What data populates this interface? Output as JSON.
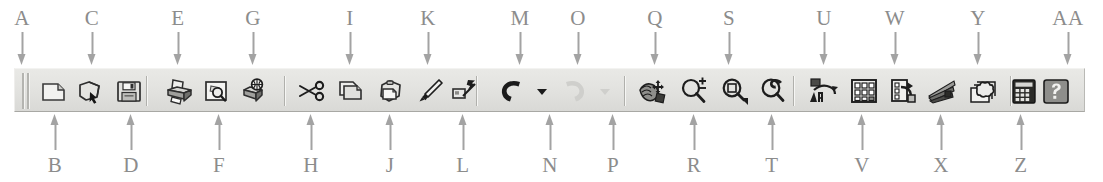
{
  "figure": {
    "type": "annotated-toolbar-diagram",
    "background": "#ffffff",
    "callout_color": "#8c8c8c"
  },
  "toolbar": {
    "name": "standard-toolbar",
    "background": "#e5e5e2",
    "grip_label": "A",
    "groups": [
      {
        "name": "file-group",
        "buttons": [
          {
            "key": "B",
            "name": "new-button",
            "icon": "new-document-icon",
            "enabled": true,
            "dropdown": false
          },
          {
            "key": "C",
            "name": "open-button",
            "icon": "open-folder-icon",
            "enabled": true,
            "dropdown": false
          },
          {
            "key": "D",
            "name": "save-button",
            "icon": "floppy-disk-icon",
            "enabled": true,
            "dropdown": false
          }
        ]
      },
      {
        "name": "print-group",
        "buttons": [
          {
            "key": "E",
            "name": "plot-button",
            "icon": "printer-icon",
            "enabled": true,
            "dropdown": false
          },
          {
            "key": "F",
            "name": "plot-preview-button",
            "icon": "print-preview-icon",
            "enabled": true,
            "dropdown": false
          },
          {
            "key": "G",
            "name": "publish-button",
            "icon": "publish-icon",
            "enabled": true,
            "dropdown": false
          }
        ]
      },
      {
        "name": "clipboard-group",
        "buttons": [
          {
            "key": "H",
            "name": "cut-button",
            "icon": "scissors-icon",
            "enabled": true,
            "dropdown": false
          },
          {
            "key": "I",
            "name": "copy-button",
            "icon": "copy-pages-icon",
            "enabled": true,
            "dropdown": false
          },
          {
            "key": "J",
            "name": "paste-button",
            "icon": "clipboard-paste-icon",
            "enabled": true,
            "dropdown": false
          },
          {
            "key": "K",
            "name": "match-properties-button",
            "icon": "paintbrush-icon",
            "enabled": true,
            "dropdown": false
          },
          {
            "key": "L",
            "name": "block-editor-button",
            "icon": "quick-edit-icon",
            "enabled": true,
            "dropdown": false
          }
        ]
      },
      {
        "name": "undo-redo-group",
        "buttons": [
          {
            "key": "M",
            "name": "undo-button",
            "icon": "undo-arrow-icon",
            "enabled": true,
            "dropdown": false
          },
          {
            "key": "N",
            "name": "undo-dropdown",
            "icon": "chevron-down-icon",
            "enabled": true,
            "dropdown": true
          },
          {
            "key": "O",
            "name": "redo-button",
            "icon": "redo-arrow-icon",
            "enabled": false,
            "dropdown": false
          },
          {
            "key": "P",
            "name": "redo-dropdown",
            "icon": "chevron-down-icon",
            "enabled": false,
            "dropdown": true
          }
        ]
      },
      {
        "name": "view-navigate-group",
        "buttons": [
          {
            "key": "Q",
            "name": "pan-realtime-button",
            "icon": "pan-hand-icon",
            "enabled": true,
            "dropdown": false
          },
          {
            "key": "R",
            "name": "zoom-realtime-button",
            "icon": "zoom-realtime-icon",
            "enabled": true,
            "dropdown": false
          },
          {
            "key": "S",
            "name": "zoom-window-button",
            "icon": "zoom-window-icon",
            "enabled": true,
            "dropdown": true
          },
          {
            "key": "T",
            "name": "zoom-previous-button",
            "icon": "zoom-previous-icon",
            "enabled": true,
            "dropdown": false
          }
        ]
      },
      {
        "name": "palettes-group",
        "buttons": [
          {
            "key": "U",
            "name": "properties-button",
            "icon": "properties-palette-icon",
            "enabled": true,
            "dropdown": false
          },
          {
            "key": "V",
            "name": "design-center-button",
            "icon": "design-center-icon",
            "enabled": true,
            "dropdown": false
          },
          {
            "key": "W",
            "name": "tool-palettes-button",
            "icon": "tool-palettes-icon",
            "enabled": true,
            "dropdown": false
          },
          {
            "key": "X",
            "name": "sheet-set-button",
            "icon": "sheet-set-icon",
            "enabled": true,
            "dropdown": false
          },
          {
            "key": "Y",
            "name": "markup-set-button",
            "icon": "markup-cloud-icon",
            "enabled": true,
            "dropdown": false
          },
          {
            "key": "Z",
            "name": "calculator-button",
            "icon": "calculator-icon",
            "enabled": true,
            "dropdown": false
          }
        ]
      },
      {
        "name": "help-group",
        "buttons": [
          {
            "key": "AA",
            "name": "help-button",
            "icon": "question-mark-icon",
            "enabled": true,
            "dropdown": false
          }
        ]
      }
    ]
  },
  "callouts": {
    "top": [
      "A",
      "C",
      "E",
      "G",
      "I",
      "K",
      "M",
      "O",
      "Q",
      "S",
      "U",
      "W",
      "Y",
      "AA"
    ],
    "bottom": [
      "B",
      "D",
      "F",
      "H",
      "J",
      "L",
      "N",
      "P",
      "R",
      "T",
      "V",
      "X",
      "Z"
    ]
  }
}
